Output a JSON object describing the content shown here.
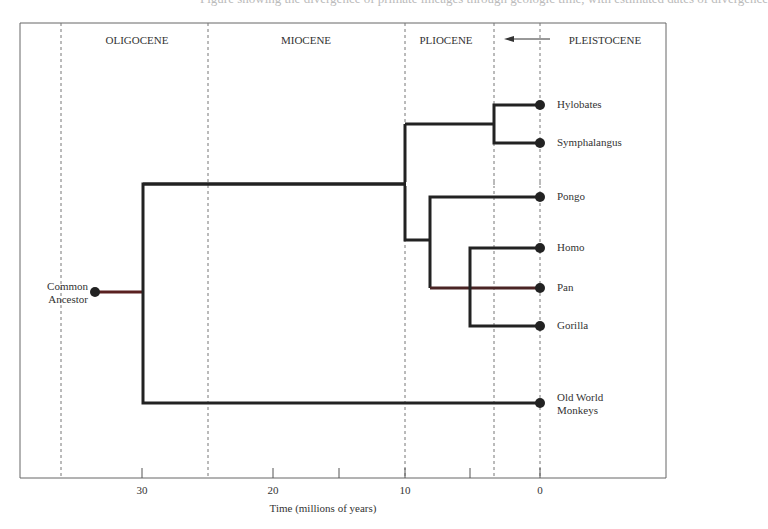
{
  "cropped_caption": "Figure showing the divergence of primate lineages through geologic time, with estimated dates of divergence",
  "epochs": [
    {
      "label": "OLIGOCENE",
      "x": 137
    },
    {
      "label": "MIOCENE",
      "x": 306
    },
    {
      "label": "PLIOCENE",
      "x": 446
    },
    {
      "label": "PLEISTOCENE",
      "x": 605
    }
  ],
  "pleistocene_arrow": "←",
  "axis": {
    "title": "Time (millions of years)",
    "ticks": [
      {
        "label": "30",
        "x": 142
      },
      {
        "label": "20",
        "x": 273
      },
      {
        "label": "10",
        "x": 405
      },
      {
        "label": "0",
        "x": 540
      }
    ]
  },
  "taxa": [
    {
      "name": "Hylobates",
      "y": 105
    },
    {
      "name": "Symphalangus",
      "y": 143
    },
    {
      "name": "Pongo",
      "y": 197
    },
    {
      "name": "Homo",
      "y": 248
    },
    {
      "name": "Pan",
      "y": 288
    },
    {
      "name": "Gorilla",
      "y": 326
    },
    {
      "name": "Old World",
      "name2": "Monkeys",
      "y": 403
    }
  ],
  "root": {
    "line1": "Common",
    "line2": "Ancestor"
  },
  "chart_data": {
    "type": "tree",
    "xlabel": "Time (millions of years)",
    "x_ticks": [
      30,
      20,
      10,
      0
    ],
    "epoch_boundaries_mya": [
      36.5,
      25,
      10,
      3.5,
      0
    ],
    "divergences_mya": {
      "Old World Monkeys vs Hominoids": 30,
      "Hylobatids vs Great Apes": 10,
      "Hylobates vs Symphalangus": 3.5,
      "Pongo vs African apes": 8,
      "Gorilla vs Homo+Pan": 5
    }
  }
}
